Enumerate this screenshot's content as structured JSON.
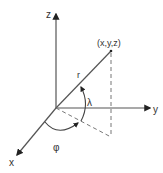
{
  "diagram": {
    "axes": {
      "z_label": "z",
      "y_label": "y",
      "x_label": "x"
    },
    "point_label": "(x,y,z)",
    "radius_label": "r",
    "elevation_angle_label": "λ",
    "azimuth_angle_label": "φ",
    "colors": {
      "stroke": "#333333",
      "background": "#ffffff"
    }
  }
}
